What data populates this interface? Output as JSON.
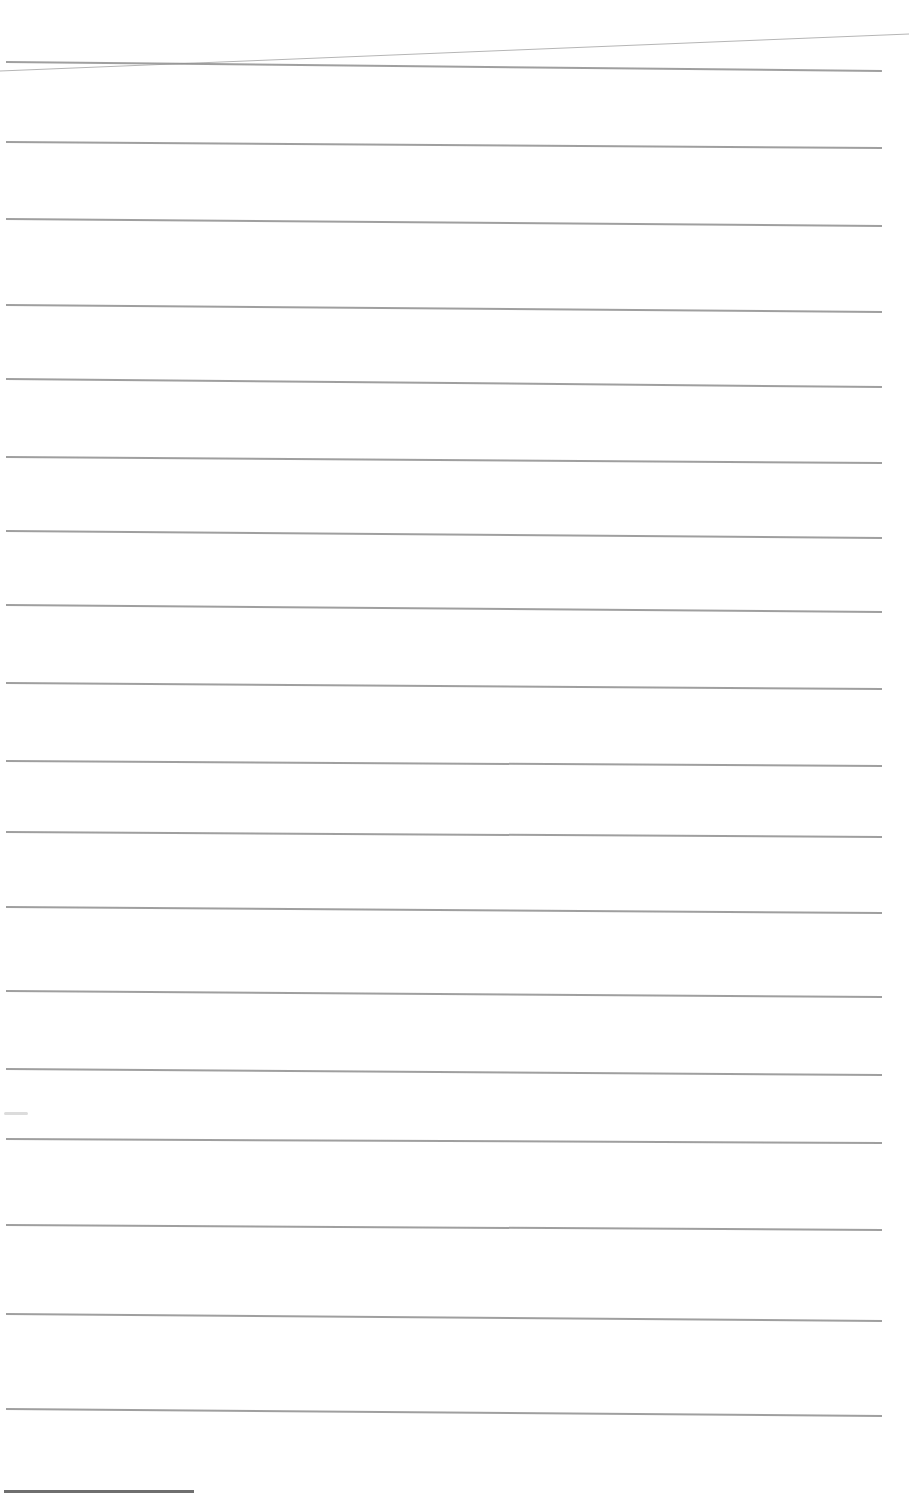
{
  "document": {
    "type": "lined paper",
    "content": "",
    "rule_color": "#8e8e8e",
    "background": "#ffffff",
    "rules_left_y": [
      61,
      141,
      218,
      304,
      378,
      456,
      530,
      604,
      682,
      760,
      831,
      906,
      990,
      1068,
      1138,
      1224,
      1313,
      1408
    ],
    "rules_right_y": [
      70,
      147,
      225,
      311,
      386,
      462,
      537,
      611,
      688,
      765,
      836,
      912,
      996,
      1074,
      1142,
      1229,
      1320,
      1415
    ]
  }
}
